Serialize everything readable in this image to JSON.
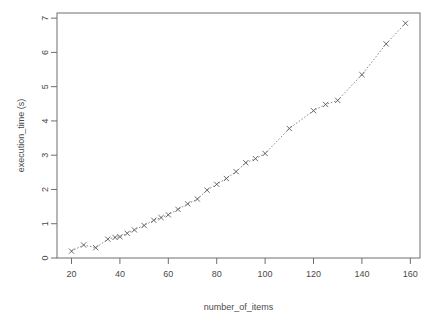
{
  "chart_data": {
    "type": "scatter",
    "title": "",
    "xlabel": "number_of_items",
    "ylabel": "execution_time (s)",
    "xlim": [
      14,
      164
    ],
    "ylim": [
      0,
      7.15
    ],
    "xticks": [
      20,
      40,
      60,
      80,
      100,
      120,
      140,
      160
    ],
    "xtick_labels": [
      "20",
      "40",
      "60",
      "80",
      "100",
      "120",
      "140",
      "160"
    ],
    "yticks": [
      0,
      1,
      2,
      3,
      4,
      5,
      6,
      7
    ],
    "ytick_labels": [
      "0",
      "1",
      "2",
      "3",
      "4",
      "5",
      "6",
      "7"
    ],
    "grid": false,
    "legend": null,
    "marker": "x",
    "connected": true,
    "line_style": "dotted",
    "marker_color": "#5a5a5a",
    "line_color": "#8c8c8c",
    "axis_color": "#6e6e6e",
    "background": "#ffffff",
    "x": [
      20,
      25,
      30,
      35,
      38,
      40,
      43,
      46,
      50,
      54,
      57,
      60,
      64,
      68,
      72,
      76,
      80,
      84,
      88,
      92,
      96,
      100,
      110,
      120,
      125,
      130,
      140,
      150,
      158
    ],
    "values": [
      0.2,
      0.38,
      0.3,
      0.55,
      0.6,
      0.62,
      0.72,
      0.82,
      0.95,
      1.1,
      1.18,
      1.26,
      1.42,
      1.58,
      1.72,
      1.98,
      2.15,
      2.32,
      2.52,
      2.78,
      2.9,
      3.05,
      3.78,
      4.3,
      4.48,
      4.6,
      5.35,
      6.25,
      6.85
    ],
    "series_name": "execution_time"
  },
  "axes": {
    "y_title": "execution_time (s)",
    "x_title": "number_of_items"
  }
}
